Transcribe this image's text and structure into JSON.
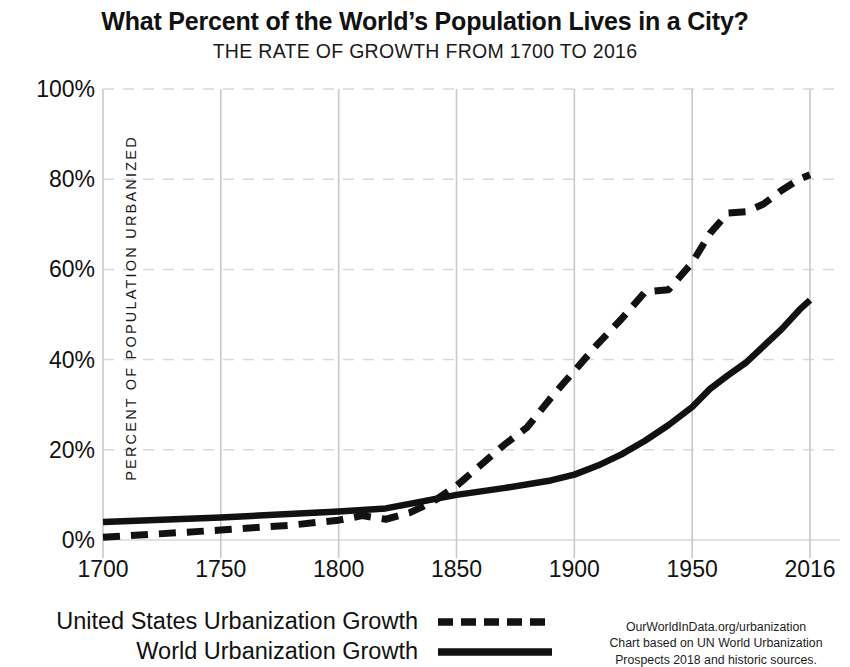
{
  "header": {
    "title": "What Percent of the World’s Population Lives in a City?",
    "subtitle": "THE RATE OF GROWTH FROM 1700 TO 2016"
  },
  "axes": {
    "y_title": "PERCENT OF POPULATION URBANIZED",
    "y_ticks": [
      "0%",
      "20%",
      "40%",
      "60%",
      "80%",
      "100%"
    ],
    "x_ticks": [
      "1700",
      "1750",
      "1800",
      "1850",
      "1900",
      "1950",
      "2016"
    ]
  },
  "legend": {
    "us_label": "United States Urbanization Growth",
    "world_label": "World Urbanization Growth",
    "us_style": "dashed",
    "world_style": "solid"
  },
  "source": {
    "line1": "OurWorldInData.org/urbanization",
    "line2": "Chart based on UN World Urbanization",
    "line3": "Prospects 2018 and historic sources."
  },
  "colors": {
    "line": "#111111",
    "grid": "#d8d8d8",
    "axis": "#c9c9c9",
    "background": "#ffffff"
  },
  "chart_data": {
    "type": "line",
    "title": "What Percent of the World’s Population Lives in a City?",
    "subtitle": "THE RATE OF GROWTH FROM 1700 TO 2016",
    "xlabel": "",
    "ylabel": "PERCENT OF POPULATION URBANIZED",
    "xlim": [
      1700,
      2016
    ],
    "ylim": [
      0,
      100
    ],
    "yticks": [
      0,
      20,
      40,
      60,
      80,
      100
    ],
    "xticks": [
      1700,
      1750,
      1800,
      1850,
      1900,
      1950,
      2016
    ],
    "grid": true,
    "legend_position": "bottom-left",
    "series": [
      {
        "name": "United States Urbanization Growth",
        "style": "dashed",
        "x": [
          1700,
          1750,
          1780,
          1800,
          1810,
          1820,
          1830,
          1840,
          1850,
          1860,
          1870,
          1880,
          1890,
          1900,
          1910,
          1920,
          1930,
          1940,
          1950,
          1960,
          1970,
          1980,
          1990,
          2000,
          2010,
          2016
        ],
        "y": [
          0.6,
          2.2,
          3.3,
          4.4,
          5.4,
          4.6,
          6.0,
          8.5,
          12.0,
          16.5,
          21.0,
          25.0,
          31.5,
          37.5,
          43.5,
          49.0,
          55.0,
          55.5,
          61.5,
          68.0,
          72.5,
          72.8,
          74.5,
          77.5,
          80.0,
          81.0
        ]
      },
      {
        "name": "World Urbanization Growth",
        "style": "solid",
        "x": [
          1700,
          1750,
          1800,
          1820,
          1840,
          1850,
          1870,
          1890,
          1900,
          1910,
          1920,
          1930,
          1940,
          1950,
          1960,
          1970,
          1980,
          1990,
          2000,
          2010,
          2016
        ],
        "y": [
          4.0,
          5.0,
          6.3,
          7.0,
          9.0,
          10.0,
          11.5,
          13.2,
          14.5,
          16.5,
          19.0,
          22.0,
          25.5,
          29.5,
          33.5,
          36.5,
          39.3,
          43.0,
          46.7,
          51.0,
          53.2
        ]
      }
    ],
    "annotations": [
      "Crossover of the two series occurs near 1840 at about 10%.",
      "United States line plateaus near 55% in the 1930s and near 73% in the 1970s."
    ]
  }
}
